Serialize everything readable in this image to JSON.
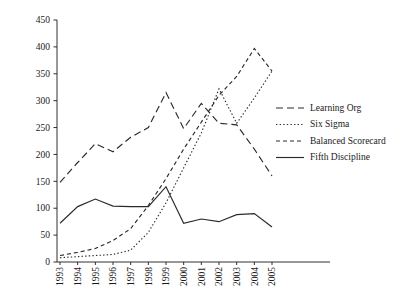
{
  "chart_data": {
    "type": "line",
    "title": "",
    "xlabel": "",
    "ylabel": "",
    "grid": false,
    "legend_position": "right",
    "xlim": [
      1993,
      2005
    ],
    "ylim": [
      0,
      450
    ],
    "ytick_step": 50,
    "categories": [
      "1993",
      "1994",
      "1995",
      "1996",
      "1997",
      "1998",
      "1999",
      "2000",
      "2001",
      "2002",
      "2003",
      "2004",
      "2005"
    ],
    "yticks": [
      "0",
      "50",
      "100",
      "150",
      "200",
      "250",
      "300",
      "350",
      "400",
      "450"
    ],
    "series": [
      {
        "name": "Learning Org",
        "style": "long-dash",
        "dasharray": "7,4",
        "values": [
          148,
          185,
          220,
          205,
          232,
          250,
          315,
          248,
          295,
          258,
          255,
          210,
          160
        ]
      },
      {
        "name": "Six Sigma",
        "style": "dotted",
        "dasharray": "1.4,2.2",
        "values": [
          8,
          10,
          12,
          14,
          22,
          55,
          110,
          175,
          240,
          322,
          258,
          305,
          355
        ]
      },
      {
        "name": "Balanced Scorecard",
        "style": "short-dash",
        "dasharray": "4,3",
        "values": [
          12,
          18,
          25,
          40,
          62,
          105,
          155,
          210,
          260,
          310,
          345,
          397,
          355
        ]
      },
      {
        "name": "Fifth Discipline",
        "style": "solid",
        "dasharray": "none",
        "values": [
          72,
          103,
          117,
          104,
          103,
          103,
          140,
          72,
          80,
          75,
          88,
          90,
          65
        ]
      }
    ]
  },
  "legend": {
    "items": [
      {
        "label": "Learning Org",
        "dasharray": "7,4"
      },
      {
        "label": "Six Sigma",
        "dasharray": "1.4,2.2"
      },
      {
        "label": "Balanced Scorecard",
        "dasharray": "4,3"
      },
      {
        "label": "Fifth Discipline",
        "dasharray": "none"
      }
    ]
  }
}
